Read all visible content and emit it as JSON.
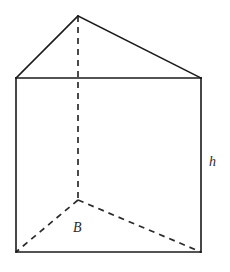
{
  "figure": {
    "name": "triangular-prism",
    "background_color": "#ffffff",
    "stroke_color": "#1a1a1a",
    "hidden_stroke_color": "#2b2b2b",
    "labels": {
      "height": "h",
      "base": "B"
    },
    "label_positions": {
      "height": {
        "x": 209,
        "y": 155
      },
      "base": {
        "x": 73,
        "y": 221
      }
    },
    "vertices": {
      "apex_back_top": {
        "x": 78,
        "y": 16
      },
      "front_left_top": {
        "x": 16,
        "y": 78
      },
      "front_right_top": {
        "x": 201,
        "y": 78
      },
      "front_left_bottom": {
        "x": 16,
        "y": 252
      },
      "front_right_bottom": {
        "x": 201,
        "y": 252
      },
      "apex_back_bottom": {
        "x": 78,
        "y": 200
      }
    },
    "solid_edges": [
      "front_left_top -> apex_back_top",
      "apex_back_top -> front_right_top",
      "front_left_top -> front_right_top",
      "front_left_top -> front_left_bottom",
      "front_right_top -> front_right_bottom",
      "front_left_bottom -> front_right_bottom"
    ],
    "hidden_edges": [
      "apex_back_top -> apex_back_bottom",
      "apex_back_bottom -> front_left_bottom",
      "apex_back_bottom -> front_right_bottom"
    ],
    "dash_pattern": "6 5",
    "stroke_width": 1.6
  }
}
